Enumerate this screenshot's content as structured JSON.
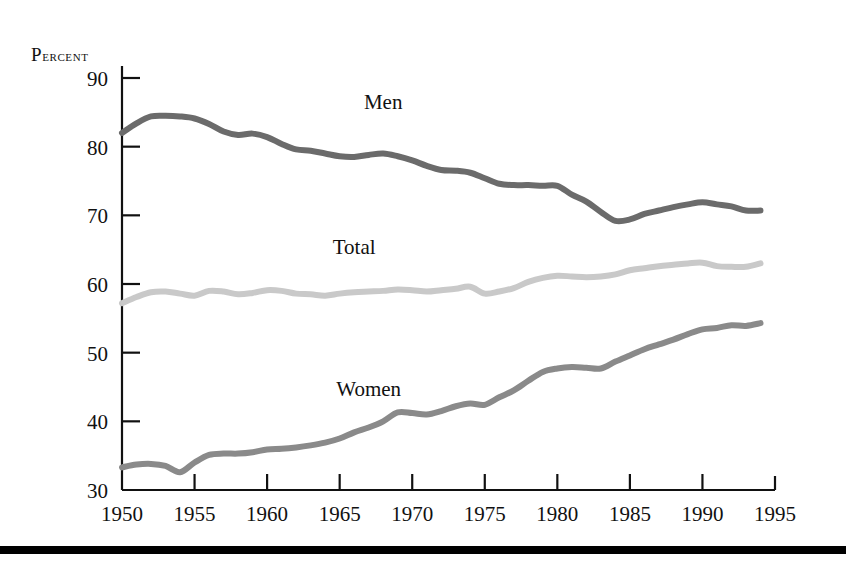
{
  "figure": {
    "y_axis_title": "Percent",
    "y_axis_title_first": "P",
    "y_axis_title_rest": "ercent",
    "bottom_rule_color": "#000000"
  },
  "series_labels": {
    "men": "Men",
    "total": "Total",
    "women": "Women"
  },
  "colors": {
    "men": "#6b6b6b",
    "total": "#c9c9c9",
    "women": "#8a8a8a",
    "axis": "#111111",
    "background": "#ffffff"
  },
  "chart_data": {
    "type": "line",
    "title": "",
    "subtitle": "",
    "xlabel": "",
    "ylabel": "Percent",
    "xlim": [
      1950,
      1995
    ],
    "ylim": [
      30,
      90
    ],
    "grid": false,
    "legend": "inline-labels",
    "x_ticks": [
      1950,
      1955,
      1960,
      1965,
      1970,
      1975,
      1980,
      1985,
      1990,
      1995
    ],
    "y_ticks": [
      30,
      40,
      50,
      60,
      70,
      80,
      90
    ],
    "x": [
      1950,
      1951,
      1952,
      1953,
      1954,
      1955,
      1956,
      1957,
      1958,
      1959,
      1960,
      1961,
      1962,
      1963,
      1964,
      1965,
      1966,
      1967,
      1968,
      1969,
      1970,
      1971,
      1972,
      1973,
      1974,
      1975,
      1976,
      1977,
      1978,
      1979,
      1980,
      1981,
      1982,
      1983,
      1984,
      1985,
      1986,
      1987,
      1988,
      1989,
      1990,
      1991,
      1992,
      1993,
      1994
    ],
    "series": [
      {
        "name": "Men",
        "color": "#6b6b6b",
        "label_x": 1968,
        "label_y": 85.5,
        "values": [
          82.0,
          83.4,
          84.4,
          84.5,
          84.4,
          84.1,
          83.3,
          82.2,
          81.7,
          81.9,
          81.4,
          80.4,
          79.6,
          79.4,
          79.0,
          78.6,
          78.5,
          78.8,
          79.0,
          78.6,
          78.0,
          77.2,
          76.6,
          76.5,
          76.2,
          75.4,
          74.6,
          74.4,
          74.4,
          74.3,
          74.3,
          73.0,
          72.0,
          70.5,
          69.2,
          69.4,
          70.2,
          70.7,
          71.2,
          71.6,
          71.9,
          71.6,
          71.3,
          70.7,
          70.7
        ]
      },
      {
        "name": "Total",
        "color": "#c9c9c9",
        "label_x": 1966,
        "label_y": 64.3,
        "values": [
          57.2,
          58.1,
          58.8,
          58.9,
          58.6,
          58.3,
          59.0,
          58.9,
          58.5,
          58.7,
          59.1,
          59.0,
          58.6,
          58.5,
          58.3,
          58.6,
          58.8,
          58.9,
          59.0,
          59.2,
          59.1,
          58.9,
          59.1,
          59.3,
          59.6,
          58.6,
          58.9,
          59.4,
          60.3,
          60.9,
          61.2,
          61.1,
          61.0,
          61.1,
          61.4,
          62.0,
          62.3,
          62.6,
          62.8,
          63.0,
          63.1,
          62.6,
          62.5,
          62.5,
          63.0
        ]
      },
      {
        "name": "Women",
        "color": "#8a8a8a",
        "label_x": 1967,
        "label_y": 43.7,
        "values": [
          33.3,
          33.7,
          33.8,
          33.5,
          32.6,
          34.0,
          35.1,
          35.3,
          35.3,
          35.5,
          35.9,
          36.0,
          36.2,
          36.5,
          36.9,
          37.5,
          38.4,
          39.1,
          40.0,
          41.3,
          41.2,
          41.0,
          41.5,
          42.2,
          42.6,
          42.4,
          43.5,
          44.5,
          45.9,
          47.2,
          47.7,
          47.9,
          47.8,
          47.7,
          48.7,
          49.6,
          50.5,
          51.2,
          51.9,
          52.7,
          53.4,
          53.6,
          54.0,
          53.9,
          54.3
        ]
      }
    ],
    "annotations": [
      {
        "text": "Men",
        "x": 1968,
        "y": 85.5
      },
      {
        "text": "Total",
        "x": 1966,
        "y": 64.3
      },
      {
        "text": "Women",
        "x": 1967,
        "y": 43.7
      }
    ]
  }
}
